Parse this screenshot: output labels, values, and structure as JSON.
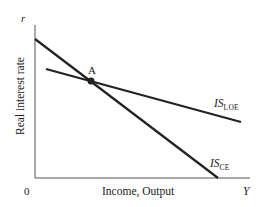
{
  "diagram": {
    "axes": {
      "y_axis_symbol": "r",
      "y_axis_label": "Real interest rate",
      "x_axis_symbol": "Y",
      "x_axis_label": "Income, Output",
      "origin_label": "0"
    },
    "curves": [
      {
        "name": "IS_CE",
        "label_main": "IS",
        "label_sub": "CE",
        "from": [
          35,
          39
        ],
        "to": [
          218,
          178
        ]
      },
      {
        "name": "IS_LOE",
        "label_main": "IS",
        "label_sub": "LOE",
        "from": [
          46,
          69
        ],
        "to": [
          241,
          122
        ]
      }
    ],
    "points": [
      {
        "name": "A",
        "label": "A",
        "at": [
          91,
          81
        ]
      }
    ],
    "colors": {
      "line": "#222222",
      "background": "#ffffff"
    }
  }
}
